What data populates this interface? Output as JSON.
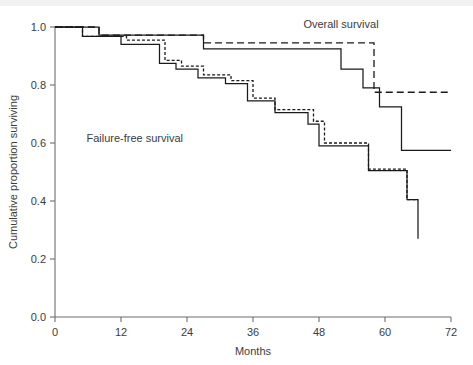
{
  "chart_data": {
    "type": "line",
    "title": "",
    "subtitle": "",
    "xlabel": "Months",
    "ylabel": "Cumulative proportion surviving",
    "xlim": [
      0,
      72
    ],
    "ylim": [
      0.0,
      1.0
    ],
    "xticks": [
      0,
      12,
      24,
      36,
      48,
      60,
      72
    ],
    "xtick_labels": [
      "0",
      "12",
      "24",
      "36",
      "48",
      "60",
      "72"
    ],
    "yticks": [
      0.0,
      0.2,
      0.4,
      0.6,
      0.8,
      1.0
    ],
    "ytick_labels": [
      "0.0",
      "0.2",
      "0.4",
      "0.6",
      "0.8",
      "1.0"
    ],
    "grid": false,
    "legend_position": "none",
    "step_shape": "post",
    "annotations": [
      {
        "name": "overall-survival-label",
        "text": "Overall survival",
        "x": 52.0,
        "y": 0.995
      },
      {
        "name": "failure-free-survival-label",
        "text": "Failure-free survival",
        "x": 14.5,
        "y": 0.605
      }
    ],
    "series": [
      {
        "name": "Overall survival (solid)",
        "group": "overall",
        "style": "solid",
        "color": "#1a1a1a",
        "x": [
          0,
          8,
          13,
          27,
          52,
          56,
          59,
          63,
          72
        ],
        "y": [
          1.0,
          0.972,
          0.972,
          0.925,
          0.855,
          0.79,
          0.725,
          0.575,
          0.575
        ]
      },
      {
        "name": "Overall survival (dashed)",
        "group": "overall",
        "style": "dashed",
        "color": "#1a1a1a",
        "x": [
          0,
          8,
          13,
          27,
          56,
          58,
          72
        ],
        "y": [
          1.0,
          0.972,
          0.972,
          0.945,
          0.945,
          0.775,
          0.775
        ]
      },
      {
        "name": "Failure-free survival (solid)",
        "group": "failure-free",
        "style": "solid",
        "color": "#1a1a1a",
        "x": [
          0,
          5,
          9,
          12,
          16,
          19,
          22,
          26,
          31,
          35,
          40,
          43,
          46,
          48,
          57,
          60,
          64,
          66
        ],
        "y": [
          1.0,
          0.968,
          0.968,
          0.94,
          0.94,
          0.875,
          0.855,
          0.825,
          0.805,
          0.745,
          0.705,
          0.705,
          0.665,
          0.59,
          0.505,
          0.505,
          0.405,
          0.27
        ]
      },
      {
        "name": "Failure-free survival (dashed)",
        "group": "failure-free",
        "style": "dashed",
        "color": "#1a1a1a",
        "x": [
          0,
          5,
          9,
          13,
          17,
          20,
          23,
          27,
          32,
          36,
          40,
          44,
          47,
          49,
          57,
          61,
          64,
          66
        ],
        "y": [
          1.0,
          0.968,
          0.968,
          0.955,
          0.955,
          0.885,
          0.865,
          0.835,
          0.815,
          0.755,
          0.715,
          0.715,
          0.675,
          0.6,
          0.51,
          0.51,
          0.405,
          0.405
        ]
      }
    ]
  }
}
